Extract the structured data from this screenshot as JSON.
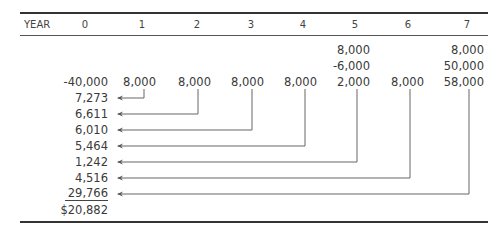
{
  "header": {
    "label": "YEAR",
    "years": [
      "0",
      "1",
      "2",
      "3",
      "4",
      "5",
      "6",
      "7"
    ]
  },
  "extra_rows": {
    "year5": [
      "8,000",
      "-6,000"
    ],
    "year7": [
      "8,000",
      "50,000"
    ]
  },
  "cash_flows": [
    "-40,000",
    "8,000",
    "8,000",
    "8,000",
    "8,000",
    "2,000",
    "8,000",
    "58,000"
  ],
  "present_values": [
    "7,273",
    "6,611",
    "6,010",
    "5,464",
    "1,242",
    "4,516",
    "29,766"
  ],
  "total": "$20,882",
  "colors": {
    "line": "#666666",
    "rule": "#333333",
    "text": "#3a3a3a"
  }
}
